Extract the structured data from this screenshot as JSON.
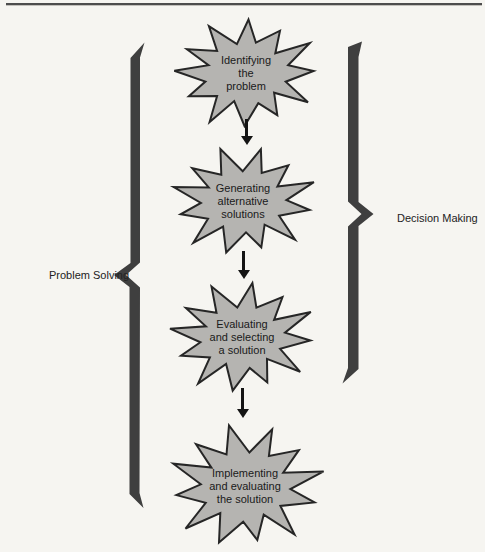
{
  "labels": {
    "left": "Problem Solving",
    "right": "Decision Making"
  },
  "steps": [
    {
      "lines": [
        "Identifying",
        "the",
        "problem"
      ]
    },
    {
      "lines": [
        "Generating",
        "alternative",
        "solutions"
      ]
    },
    {
      "lines": [
        "Evaluating",
        "and selecting",
        "a solution"
      ]
    },
    {
      "lines": [
        "Implementing",
        "and evaluating",
        "the solution"
      ]
    }
  ],
  "colors": {
    "burst_fill": "#b5b4b1",
    "burst_stroke": "#262626",
    "brace": "#3f3f3f",
    "arrow": "#141414",
    "rule": "#4d4d4d"
  }
}
